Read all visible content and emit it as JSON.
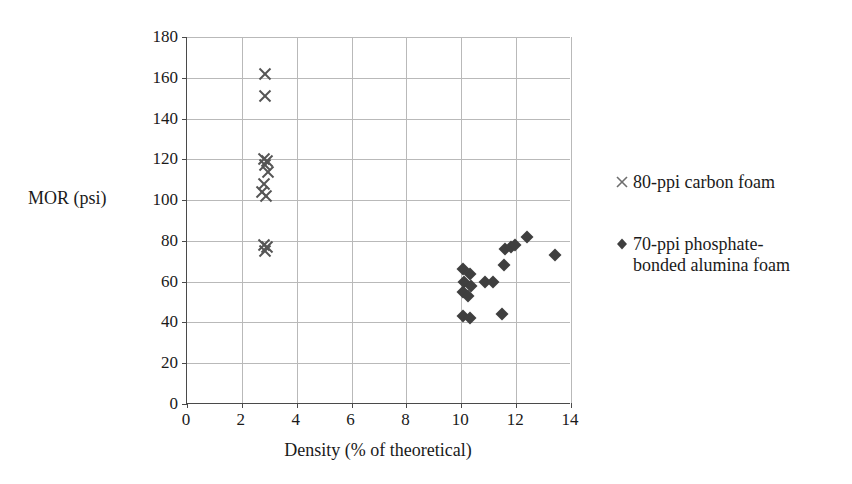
{
  "chart_data": {
    "type": "scatter",
    "title": "",
    "xlabel": "Density (% of theoretical)",
    "ylabel": "MOR (psi)",
    "xlim": [
      0,
      14
    ],
    "ylim": [
      0,
      180
    ],
    "xticks": [
      0,
      2,
      4,
      6,
      8,
      10,
      12,
      14
    ],
    "yticks": [
      0,
      20,
      40,
      60,
      80,
      100,
      120,
      140,
      160,
      180
    ],
    "grid": true,
    "legend_position": "right",
    "series": [
      {
        "name": "80-ppi carbon foam",
        "marker": "x",
        "color": "#555555",
        "points": [
          [
            2.85,
            162
          ],
          [
            2.85,
            151
          ],
          [
            2.8,
            120
          ],
          [
            2.92,
            119
          ],
          [
            2.86,
            117
          ],
          [
            2.95,
            114
          ],
          [
            2.8,
            108
          ],
          [
            2.74,
            104
          ],
          [
            2.88,
            102
          ],
          [
            2.8,
            78
          ],
          [
            2.9,
            77
          ],
          [
            2.84,
            75
          ]
        ]
      },
      {
        "name": "70-ppi phosphate-bonded alumina foam",
        "marker": "diamond",
        "color": "#3f3f3f",
        "points": [
          [
            10.05,
            66
          ],
          [
            10.3,
            64
          ],
          [
            10.1,
            60
          ],
          [
            10.35,
            58
          ],
          [
            10.05,
            55
          ],
          [
            10.25,
            53
          ],
          [
            10.05,
            43
          ],
          [
            10.3,
            42
          ],
          [
            10.85,
            60
          ],
          [
            11.15,
            60
          ],
          [
            11.5,
            44
          ],
          [
            11.55,
            68
          ],
          [
            11.6,
            76
          ],
          [
            11.8,
            77
          ],
          [
            11.95,
            78
          ],
          [
            12.4,
            82
          ],
          [
            13.4,
            73
          ]
        ]
      }
    ]
  },
  "legend": {
    "entries": [
      {
        "marker": "x",
        "label": "80-ppi carbon foam"
      },
      {
        "marker": "diamond",
        "label": "70-ppi phosphate-\nbonded alumina foam"
      }
    ]
  },
  "colors": {
    "axis": "#4a4a4a",
    "grid": "#b9b9b9",
    "text": "#1a1a1a",
    "series_carbon": "#555555",
    "series_alumina": "#3f3f3f",
    "background": "#ffffff"
  }
}
